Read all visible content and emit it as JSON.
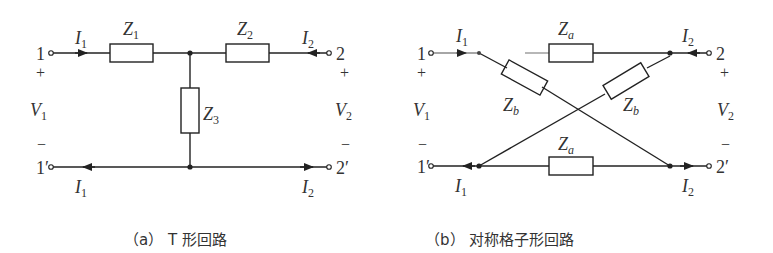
{
  "figures": [
    {
      "id": "a",
      "caption": "（a） T 形回路",
      "type": "T-network",
      "terminals": {
        "in_top": "1",
        "in_bottom": "1′",
        "out_top": "2",
        "out_bottom": "2′"
      },
      "voltages": {
        "left": "V",
        "left_sub": "1",
        "right": "V",
        "right_sub": "2",
        "plus": "+",
        "minus": "−"
      },
      "currents": {
        "I1_top": "I",
        "I1_top_sub": "1",
        "I2_top": "I",
        "I2_top_sub": "2",
        "I1_bottom": "I",
        "I1_bottom_sub": "1",
        "I2_bottom": "I",
        "I2_bottom_sub": "2"
      },
      "impedances": [
        {
          "name": "Z",
          "sub": "1",
          "position": "series-left"
        },
        {
          "name": "Z",
          "sub": "2",
          "position": "series-right"
        },
        {
          "name": "Z",
          "sub": "3",
          "position": "shunt"
        }
      ]
    },
    {
      "id": "b",
      "caption": "（b） 对称格子形回路",
      "type": "symmetric-lattice",
      "terminals": {
        "in_top": "1",
        "in_bottom": "1′",
        "out_top": "2",
        "out_bottom": "2′"
      },
      "voltages": {
        "left": "V",
        "left_sub": "1",
        "right": "V",
        "right_sub": "2",
        "plus": "+",
        "minus": "−"
      },
      "currents": {
        "I1_top": "I",
        "I1_top_sub": "1",
        "I2_top": "I",
        "I2_top_sub": "2",
        "I1_bottom": "I",
        "I1_bottom_sub": "1",
        "I2_bottom": "I",
        "I2_bottom_sub": "2"
      },
      "impedances": [
        {
          "name": "Z",
          "sub": "a",
          "position": "top"
        },
        {
          "name": "Z",
          "sub": "a",
          "position": "bottom"
        },
        {
          "name": "Z",
          "sub": "b",
          "position": "diagonal-left"
        },
        {
          "name": "Z",
          "sub": "b",
          "position": "diagonal-right"
        }
      ]
    }
  ]
}
